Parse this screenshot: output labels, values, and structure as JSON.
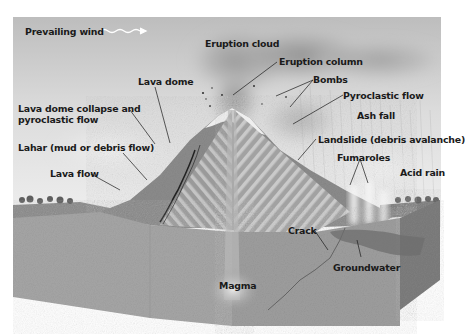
{
  "diagram": {
    "labels": {
      "prevailing_wind": "Prevailing wind",
      "eruption_cloud": "Eruption cloud",
      "eruption_column": "Eruption column",
      "bombs": "Bombs",
      "pyroclastic_flow": "Pyroclastic flow",
      "ash_fall": "Ash fall",
      "lava_dome": "Lava dome",
      "lava_dome_collapse_line1": "Lava dome collapse and",
      "lava_dome_collapse_line2": "pyroclastic flow",
      "lahar": "Lahar (mud or debris flow)",
      "lava_flow": "Lava flow",
      "landslide": "Landslide (debris avalanche)",
      "fumaroles": "Fumaroles",
      "acid_rain": "Acid rain",
      "crack": "Crack",
      "groundwater": "Groundwater",
      "magma": "Magma"
    },
    "colors": {
      "sky_top": "#c9c9c9",
      "sky_bottom": "#f2f2f2",
      "ground_front": "#a8a8a8",
      "ground_side": "#8e8e8e",
      "groundwater": "#6e6e6e",
      "label_text": "#1a1a1a"
    }
  }
}
